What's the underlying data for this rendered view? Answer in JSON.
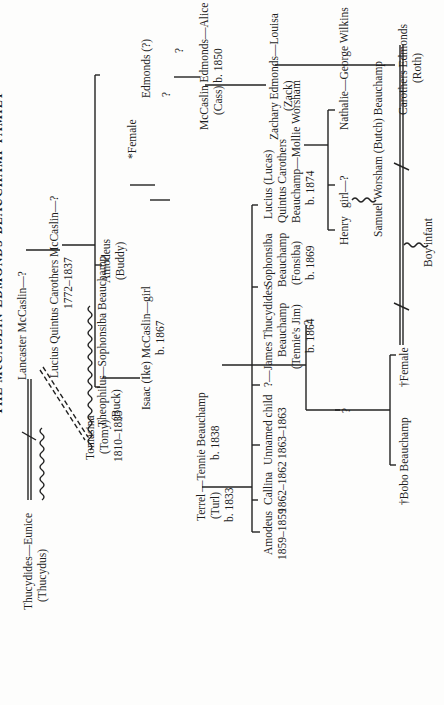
{
  "title": "THE McCASLIN-EDMONDS-BEAUCHAMP FAMILY",
  "orientation": "rotated 90° counter-clockwise",
  "people": {
    "thucydides": "Thucydides—Eunice",
    "thucydus": "(Thucydus)",
    "lancaster": "Lancaster McCaslin—?",
    "lucius": "Lucius Quintus Carothers McCaslin—?",
    "lucius_dates": "1772–1837",
    "tomasina": "Tomasina",
    "tomy": "(Tomy)",
    "tomasina_dates": "1810–1833",
    "theophilus": "Theophilus",
    "buck": "(Buck)",
    "sophonsiba_beauchamp": "—Sophonsiba Beauchamp",
    "amodeus_buddy": "Amodeus",
    "buddy": "(Buddy)",
    "female_star": "*Female",
    "edmonds_q": "Edmonds (?)",
    "q1": "?",
    "q2": "?",
    "mccaslin_edmonds": "McCaslin Edmonds—Alice",
    "cass": "(Cass) b. 1850",
    "zachary": "Zachary Edmonds—Louisa",
    "zack": "(Zack)",
    "roth": "Carothers Edmonds",
    "roth_nick": "(Roth)",
    "isaac": "Isaac (Ike) McCaslin—girl",
    "isaac_born": "b. 1867",
    "terrel": "Terrel",
    "turl": "(Turl)",
    "terrel_born": "b. 1833",
    "tennie": "—Tennie Beauchamp",
    "tennie_born": "b. 1838",
    "amodeus": "Amodeus",
    "amodeus_dates": "1859–1859",
    "callina": "Callina",
    "callina_dates": "1862–1862",
    "unnamed": "Unnamed child",
    "unnamed_dates": "1863–1863",
    "james_q": "?—",
    "james": "James Thucydides",
    "james_2": "Beauchamp",
    "james_3": "(Tennie's Jim)",
    "james_born": "b. 1864",
    "fonsiba": "Sophonsiba",
    "fonsiba_2": "Beauchamp",
    "fonsiba_3": "(Fonsiba)",
    "fonsiba_born": "b. 1869",
    "lucas": "Lucius (Lucas)",
    "lucas_2": "Quintus Carothers",
    "lucas_3": "Beauchamp—Mollie Worsham",
    "lucas_born": "b. 1874",
    "q_child": "?",
    "q_child2": "?",
    "bobo": "†Bobo Beauchamp",
    "female_dagger": "†Female",
    "henry": "Henry",
    "girl": "girl—?",
    "nathalie": "Nathalie—George Wilkins",
    "samuel": "Samuel Worsham (Butch) Beauchamp",
    "boy_infant": "Boy infant"
  }
}
